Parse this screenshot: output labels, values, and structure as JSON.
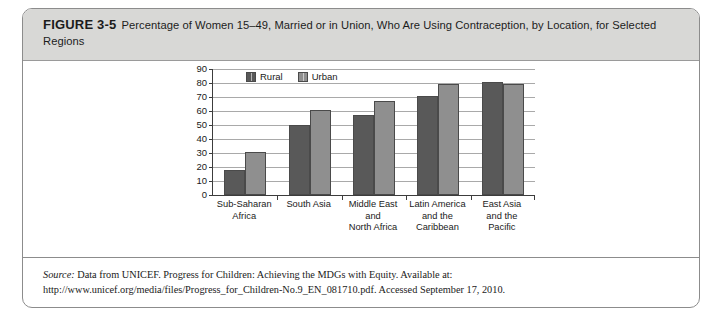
{
  "figure": {
    "label": "FIGURE 3-5",
    "caption": "Percentage of Women 15–49, Married or in Union, Who Are Using Contraception, by Location, for Selected Regions"
  },
  "source": {
    "label": "Source:",
    "text": " Data from UNICEF. Progress for Children: Achieving the MDGs with Equity. Available at: http://www.unicef.org/media/files/Progress_for_Children-No.9_EN_081710.pdf. Accessed September 17, 2010."
  },
  "colors": {
    "rural": "#595959",
    "urban": "#8f8f8f",
    "header_band": "#d8d8d6",
    "gridline": "#a9a9a9",
    "axis": "#3c3c3c",
    "border": "#8c8c8c"
  },
  "chart_data": {
    "type": "bar",
    "title": "Percentage of Women 15–49, Married or in Union, Who Are Using Contraception, by Location, for Selected Regions",
    "xlabel": "",
    "ylabel": "",
    "ylim": [
      0,
      90
    ],
    "yticks": [
      0,
      10,
      20,
      30,
      40,
      50,
      60,
      70,
      80,
      90
    ],
    "ytick_labels": [
      "0",
      "10",
      "20",
      "30",
      "40",
      "50",
      "60",
      "70",
      "80",
      "90"
    ],
    "grid": true,
    "legend_position": "top-left-inside",
    "categories": [
      "Sub-Saharan Africa",
      "South Asia",
      "Middle East and North Africa",
      "Latin America and the Caribbean",
      "East Asia and the Pacific"
    ],
    "category_label_lines": [
      [
        "Sub-Saharan",
        "Africa"
      ],
      [
        "South Asia"
      ],
      [
        "Middle East",
        "and",
        "North Africa"
      ],
      [
        "Latin America",
        "and the",
        "Caribbean"
      ],
      [
        "East Asia",
        "and the",
        "Pacific"
      ]
    ],
    "series": [
      {
        "name": "Rural",
        "color": "#595959",
        "values": [
          18,
          50,
          57,
          71,
          81
        ]
      },
      {
        "name": "Urban",
        "color": "#8f8f8f",
        "values": [
          31,
          61,
          67,
          79,
          79
        ]
      }
    ]
  }
}
